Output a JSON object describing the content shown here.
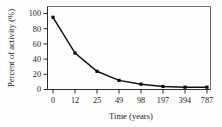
{
  "chart_data": {
    "type": "line",
    "title": "",
    "xlabel": "Time (years)",
    "ylabel": "Percent of activity (%)",
    "categories": [
      "0",
      "12",
      "25",
      "49",
      "98",
      "197",
      "394",
      "787"
    ],
    "x": [
      0,
      12,
      25,
      49,
      98,
      197,
      394,
      787
    ],
    "values": [
      95,
      48,
      24,
      12,
      7,
      4,
      3,
      3
    ],
    "series": [
      {
        "name": "Percent of activity",
        "values": [
          95,
          48,
          24,
          12,
          7,
          4,
          3,
          3
        ]
      }
    ],
    "xtick_labels": [
      "0",
      "12",
      "25",
      "49",
      "98",
      "197",
      "394",
      "787"
    ],
    "ytick_labels": [
      "0",
      "20",
      "40",
      "60",
      "80",
      "100"
    ],
    "yticks": [
      0,
      20,
      40,
      60,
      80,
      100
    ],
    "ylim": [
      0,
      100
    ],
    "grid": false,
    "legend": false,
    "legend_position": "none",
    "marker": "square",
    "line_color": "#111111",
    "marker_color": "#0d0d0d",
    "axis_color": "#2b2b2b",
    "background_color": "#ffffff",
    "x_axis_scale": "categorical"
  }
}
